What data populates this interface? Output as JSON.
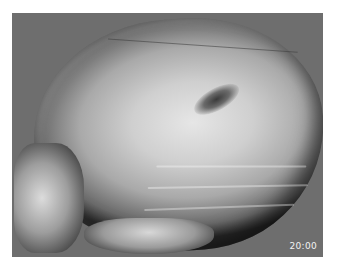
{
  "image": {
    "subject": "3D CT volume rendering of skull (lateral-oblique view)",
    "background_color": "#6e6e6e",
    "page_color": "#ffffff"
  },
  "overlay": {
    "timestamp": "20:00"
  }
}
